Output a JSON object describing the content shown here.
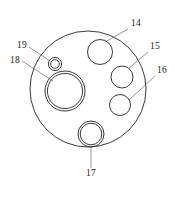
{
  "figure": {
    "kind": "patent-technical-drawing",
    "background_color": "#ffffff",
    "line_color": "#3a3a3a",
    "label_color": "#1a1a1a",
    "canvas": {
      "width": 175,
      "height": 200
    }
  },
  "body": {
    "name": "circular-plate-outline",
    "shape": "circle",
    "cx": 88,
    "cy": 89,
    "r": 58,
    "stroke_width": 1.0
  },
  "features": [
    {
      "id": "14",
      "name": "hole-14",
      "shape": "circle",
      "rings": 1,
      "cx": 100,
      "cy": 52,
      "r": 12.5
    },
    {
      "id": "15",
      "name": "hole-15",
      "shape": "circle",
      "rings": 1,
      "cx": 122,
      "cy": 77,
      "r": 11
    },
    {
      "id": "16",
      "name": "hole-16",
      "shape": "circle",
      "rings": 1,
      "cx": 120,
      "cy": 105,
      "r": 10.5
    },
    {
      "id": "17",
      "name": "hole-17",
      "shape": "concentric-circle",
      "rings": 2,
      "cx": 91,
      "cy": 134,
      "r": 13,
      "r_inner": 10.8
    },
    {
      "id": "18",
      "name": "bore-18",
      "shape": "concentric-circle",
      "rings": 2,
      "cx": 65,
      "cy": 91,
      "r": 20,
      "r_inner": 17.6
    },
    {
      "id": "19",
      "name": "hole-19",
      "shape": "concentric-circle",
      "rings": 2,
      "cx": 55,
      "cy": 64,
      "r": 6.6,
      "r_inner": 4.3
    }
  ],
  "callouts": [
    {
      "id": "14",
      "name": "callout-14",
      "label": "14",
      "text_x": 131,
      "text_y": 26,
      "leader": {
        "x1": 128,
        "y1": 29,
        "x2": 105,
        "y2": 42
      }
    },
    {
      "id": "15",
      "name": "callout-15",
      "label": "15",
      "text_x": 150,
      "text_y": 49,
      "leader": {
        "x1": 148,
        "y1": 52,
        "x2": 128,
        "y2": 69
      }
    },
    {
      "id": "16",
      "name": "callout-16",
      "label": "16",
      "text_x": 157,
      "text_y": 73,
      "leader": {
        "x1": 155,
        "y1": 76,
        "x2": 129,
        "y2": 100
      }
    },
    {
      "id": "17",
      "name": "callout-17",
      "label": "17",
      "text_x": 86,
      "text_y": 176,
      "leader": {
        "x1": 91,
        "y1": 168,
        "x2": 91,
        "y2": 147
      }
    },
    {
      "id": "18",
      "name": "callout-18",
      "label": "18",
      "text_x": 10,
      "text_y": 63,
      "leader": {
        "x1": 22,
        "y1": 61,
        "x2": 53,
        "y2": 81
      }
    },
    {
      "id": "19",
      "name": "callout-19",
      "label": "19",
      "text_x": 17,
      "text_y": 48,
      "leader": {
        "x1": 29,
        "y1": 47,
        "x2": 50,
        "y2": 61
      }
    }
  ]
}
